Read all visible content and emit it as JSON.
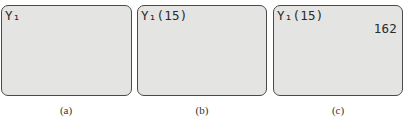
{
  "panels": [
    {
      "id": "a",
      "expression": "Y₁",
      "result": "",
      "caption": "(a)"
    },
    {
      "id": "b",
      "expression": "Y₁(15)",
      "result": "",
      "caption": "(b)"
    },
    {
      "id": "c",
      "expression": "Y₁(15)",
      "result": "162",
      "caption": "(c)"
    }
  ]
}
